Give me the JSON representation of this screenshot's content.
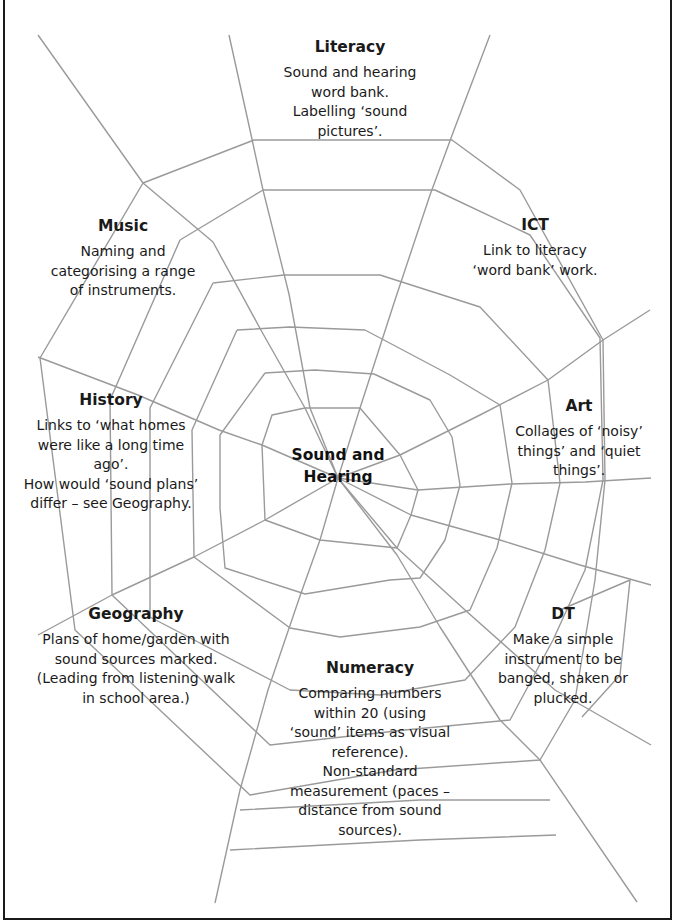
{
  "diagram": {
    "type": "topic-web",
    "center": {
      "label": "Sound and\nHearing"
    },
    "colors": {
      "web_lines": "#9a9a9a",
      "text": "#1a1a1a",
      "background": "#ffffff",
      "border": "#1a1a1a"
    },
    "nodes": [
      {
        "id": "literacy",
        "title": "Literacy",
        "body": "Sound and hearing\nword bank.\nLabelling ‘sound\npictures’."
      },
      {
        "id": "music",
        "title": "Music",
        "body": "Naming and\ncategorising a range\nof instruments."
      },
      {
        "id": "ict",
        "title": "ICT",
        "body": "Link to literacy\n‘word bank’ work."
      },
      {
        "id": "history",
        "title": "History",
        "body": "Links to ‘what homes\nwere like a long time\nago’.\nHow would ‘sound plans’\ndiffer – see Geography."
      },
      {
        "id": "art",
        "title": "Art",
        "body": "Collages of ‘noisy’\nthings’ and ‘quiet\nthings’."
      },
      {
        "id": "geography",
        "title": "Geography",
        "body": "Plans of home/garden with\nsound sources marked.\n(Leading from listening walk\nin school area.)"
      },
      {
        "id": "dt",
        "title": "DT",
        "body": "Make a simple\ninstrument to be\nbanged, shaken or\nplucked."
      },
      {
        "id": "numeracy",
        "title": "Numeracy",
        "body": "Comparing numbers\nwithin 20 (using\n‘sound’ items as visual\nreference).\nNon-standard\nmeasurement (paces –\ndistance from sound\nsources)."
      }
    ],
    "edges": [
      {
        "from": "center",
        "to": "literacy"
      },
      {
        "from": "center",
        "to": "music"
      },
      {
        "from": "center",
        "to": "ict"
      },
      {
        "from": "center",
        "to": "history"
      },
      {
        "from": "center",
        "to": "art"
      },
      {
        "from": "center",
        "to": "geography"
      },
      {
        "from": "center",
        "to": "dt"
      },
      {
        "from": "center",
        "to": "numeracy"
      }
    ]
  }
}
